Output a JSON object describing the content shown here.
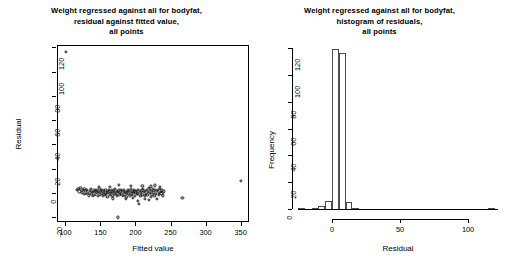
{
  "figure": {
    "background": "#ffffff",
    "foreground": "#000000",
    "point_color": "#1a1a1a",
    "bar_edge_color": "#4d4d4d",
    "bar_fill_color": "#ffffff"
  },
  "panels": {
    "left": {
      "title_lines": [
        "Weight regressed against all for bodyfat,",
        "residual against fitted value,",
        "all points"
      ],
      "xlabel": "Fitted value",
      "ylabel": "Residual",
      "xticks": [
        "100",
        "150",
        "200",
        "250",
        "300",
        "350"
      ],
      "yticks": [
        "-20",
        "0",
        "20",
        "40",
        "60",
        "80",
        "100",
        "120"
      ]
    },
    "right": {
      "title_lines": [
        "Weight regressed against all for bodyfat,",
        "histogram of residuals,",
        "all points"
      ],
      "xlabel": "Residual",
      "ylabel": "Frequency",
      "xticks": [
        "0",
        "50",
        "100"
      ],
      "yticks": [
        "0",
        "20",
        "40",
        "60",
        "80",
        "100",
        "120"
      ]
    }
  },
  "chart_data": [
    {
      "type": "scatter",
      "title": "Weight regressed against all for bodyfat, residual against fitted value, all points",
      "xlabel": "Fitted value",
      "ylabel": "Residual",
      "xlim": [
        88,
        362
      ],
      "ylim": [
        -24,
        122
      ],
      "xticks": [
        100,
        150,
        200,
        250,
        300,
        350
      ],
      "yticks": [
        -20,
        0,
        20,
        40,
        60,
        80,
        100,
        120
      ],
      "grid": false,
      "legend": false,
      "marker": "open-circle",
      "points": [
        [
          100.5,
          116.0
        ],
        [
          116.0,
          2.6
        ],
        [
          118.5,
          3.4
        ],
        [
          120.0,
          1.2
        ],
        [
          121.5,
          4.0
        ],
        [
          123.0,
          0.4
        ],
        [
          124.5,
          2.2
        ],
        [
          126.0,
          -1.0
        ],
        [
          127.0,
          3.1
        ],
        [
          128.5,
          1.6
        ],
        [
          129.5,
          -0.6
        ],
        [
          131.0,
          2.8
        ],
        [
          132.0,
          0.2
        ],
        [
          133.5,
          -2.0
        ],
        [
          134.5,
          1.4
        ],
        [
          136.0,
          3.0
        ],
        [
          137.0,
          -0.8
        ],
        [
          138.0,
          1.0
        ],
        [
          139.5,
          -2.4
        ],
        [
          140.5,
          2.0
        ],
        [
          141.5,
          0.6
        ],
        [
          142.5,
          -1.4
        ],
        [
          143.5,
          2.6
        ],
        [
          144.5,
          -0.2
        ],
        [
          145.5,
          1.8
        ],
        [
          146.5,
          -2.8
        ],
        [
          147.5,
          0.8
        ],
        [
          148.5,
          3.2
        ],
        [
          149.5,
          -1.2
        ],
        [
          150.5,
          1.4
        ],
        [
          151.5,
          -0.4
        ],
        [
          152.5,
          2.4
        ],
        [
          153.5,
          -2.2
        ],
        [
          154.5,
          0.2
        ],
        [
          155.0,
          1.6
        ],
        [
          156.0,
          -1.6
        ],
        [
          157.0,
          2.8
        ],
        [
          158.0,
          -0.6
        ],
        [
          159.0,
          1.0
        ],
        [
          160.0,
          -3.0
        ],
        [
          161.0,
          0.4
        ],
        [
          162.0,
          2.2
        ],
        [
          163.0,
          -1.8
        ],
        [
          164.0,
          1.2
        ],
        [
          165.0,
          -0.2
        ],
        [
          166.0,
          2.6
        ],
        [
          167.0,
          -2.6
        ],
        [
          168.0,
          0.6
        ],
        [
          169.0,
          1.8
        ],
        [
          170.0,
          -1.0
        ],
        [
          171.0,
          3.0
        ],
        [
          172.0,
          -0.4
        ],
        [
          173.0,
          1.4
        ],
        [
          174.0,
          -2.2
        ],
        [
          175.0,
          0.8
        ],
        [
          175.5,
          -20.2
        ],
        [
          176.0,
          2.0
        ],
        [
          177.0,
          -1.4
        ],
        [
          178.0,
          0.2
        ],
        [
          179.0,
          2.8
        ],
        [
          180.0,
          -0.8
        ],
        [
          181.0,
          1.6
        ],
        [
          182.0,
          -2.4
        ],
        [
          183.0,
          0.6
        ],
        [
          184.0,
          2.2
        ],
        [
          185.0,
          -1.2
        ],
        [
          186.0,
          1.0
        ],
        [
          187.0,
          -3.2
        ],
        [
          188.0,
          0.4
        ],
        [
          189.0,
          2.6
        ],
        [
          190.0,
          -0.6
        ],
        [
          191.0,
          1.8
        ],
        [
          192.0,
          -2.0
        ],
        [
          193.0,
          0.8
        ],
        [
          194.0,
          3.0
        ],
        [
          195.0,
          -1.6
        ],
        [
          196.0,
          1.2
        ],
        [
          197.0,
          -0.2
        ],
        [
          198.0,
          2.4
        ],
        [
          199.0,
          -2.8
        ],
        [
          200.0,
          0.6
        ],
        [
          201.0,
          1.6
        ],
        [
          202.0,
          -1.0
        ],
        [
          203.0,
          2.8
        ],
        [
          204.0,
          -0.4
        ],
        [
          205.0,
          -9.0
        ],
        [
          206.0,
          1.4
        ],
        [
          207.0,
          -2.2
        ],
        [
          208.0,
          0.2
        ],
        [
          209.0,
          2.0
        ],
        [
          210.0,
          -1.4
        ],
        [
          211.0,
          3.4
        ],
        [
          212.0,
          0.8
        ],
        [
          213.0,
          -2.6
        ],
        [
          214.0,
          1.8
        ],
        [
          215.0,
          -0.6
        ],
        [
          216.0,
          2.6
        ],
        [
          217.0,
          -1.8
        ],
        [
          218.0,
          1.0
        ],
        [
          219.0,
          4.2
        ],
        [
          220.0,
          -0.2
        ],
        [
          221.0,
          2.2
        ],
        [
          222.0,
          -3.0
        ],
        [
          223.0,
          1.4
        ],
        [
          224.0,
          -1.2
        ],
        [
          225.0,
          3.0
        ],
        [
          226.0,
          0.4
        ],
        [
          227.0,
          -2.4
        ],
        [
          228.0,
          2.8
        ],
        [
          229.0,
          -0.8
        ],
        [
          230.0,
          1.6
        ],
        [
          231.0,
          -5.2
        ],
        [
          232.0,
          2.4
        ],
        [
          233.0,
          0.2
        ],
        [
          234.0,
          -1.6
        ],
        [
          235.0,
          3.2
        ],
        [
          236.0,
          1.0
        ],
        [
          237.0,
          -0.4
        ],
        [
          238.0,
          2.0
        ],
        [
          239.0,
          -2.0
        ],
        [
          240.0,
          1.2
        ],
        [
          148.0,
          5.2
        ],
        [
          163.0,
          4.8
        ],
        [
          176.0,
          6.6
        ],
        [
          193.0,
          5.6
        ],
        [
          210.0,
          6.0
        ],
        [
          222.0,
          5.4
        ],
        [
          228.0,
          6.2
        ],
        [
          235.0,
          5.0
        ],
        [
          186.0,
          -5.0
        ],
        [
          196.0,
          -4.4
        ],
        [
          168.0,
          -4.6
        ],
        [
          214.0,
          -4.8
        ],
        [
          204.0,
          -6.6
        ],
        [
          219.0,
          -5.6
        ],
        [
          267.0,
          -4.0
        ],
        [
          350.0,
          10.0
        ]
      ]
    },
    {
      "type": "bar",
      "subtype": "histogram",
      "title": "Weight regressed against all for bodyfat, histogram of residuals, all points",
      "xlabel": "Residual",
      "ylabel": "Frequency",
      "xlim": [
        -25,
        122
      ],
      "ylim": [
        0,
        120
      ],
      "xticks": [
        0,
        50,
        100
      ],
      "yticks": [
        0,
        20,
        40,
        60,
        80,
        100,
        120
      ],
      "grid": false,
      "legend": false,
      "bin_width": 5,
      "bin_starts": [
        -25,
        -20,
        -15,
        -10,
        -5,
        0,
        5,
        10,
        15,
        20,
        110,
        115
      ],
      "values": [
        1,
        0,
        1,
        2,
        6,
        119,
        116,
        5,
        1,
        0,
        0,
        1
      ]
    }
  ]
}
